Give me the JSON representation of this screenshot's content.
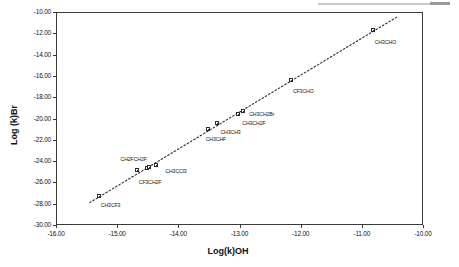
{
  "chart_data": {
    "type": "scatter",
    "title": "",
    "xlabel": "Log(k)OH",
    "ylabel": "Log (k)Br",
    "xlim": [
      -16.0,
      -10.0
    ],
    "ylim": [
      -30.0,
      -10.0
    ],
    "xticks": [
      "-16.00",
      "-15.00",
      "-14.00",
      "-13.00",
      "-12.00",
      "-11.00",
      "-10.00"
    ],
    "xtick_values": [
      -16.0,
      -15.0,
      -14.0,
      -13.0,
      -12.0,
      -11.0,
      -10.0
    ],
    "yticks": [
      "-10.00",
      "-12.00",
      "-14.00",
      "-16.00",
      "-18.00",
      "-20.00",
      "-22.00",
      "-24.00",
      "-26.00",
      "-28.00",
      "-30.00"
    ],
    "ytick_values": [
      -10.0,
      -12.0,
      -14.0,
      -16.0,
      -18.0,
      -20.0,
      -22.0,
      -24.0,
      -26.0,
      -28.0,
      -30.0
    ],
    "grid": false,
    "legend": false,
    "marker_style": "open-square",
    "trendline": {
      "style": "dotted",
      "x_start": -15.45,
      "y_start": -27.9,
      "x_end": -10.42,
      "y_end": -10.45
    },
    "points": [
      {
        "label": "CH3CF3",
        "x": -15.3,
        "y": -27.3,
        "label_dx": 2,
        "label_dy": 6
      },
      {
        "label": "CF3CH2F",
        "x": -14.68,
        "y": -24.8,
        "label_dx": 2,
        "label_dy": 9
      },
      {
        "label": "CH2FCH2F",
        "x": -14.52,
        "y": -24.62,
        "label_dx": -26,
        "label_dy": -12
      },
      {
        "label": "",
        "x": -14.48,
        "y": -24.58,
        "label_dx": 0,
        "label_dy": 0
      },
      {
        "label": "CH3CCl3",
        "x": -14.36,
        "y": -24.35,
        "label_dx": 9,
        "label_dy": 3
      },
      {
        "label": "CH3CHF",
        "x": -13.52,
        "y": -21.02,
        "label_dx": -2,
        "label_dy": 7
      },
      {
        "label": "CH3CH3",
        "x": -13.36,
        "y": -20.4,
        "label_dx": 3,
        "label_dy": 6
      },
      {
        "label": "CH3CH2F",
        "x": -13.02,
        "y": -19.55,
        "label_dx": 4,
        "label_dy": 6
      },
      {
        "label": "CH3CH2Br",
        "x": -12.94,
        "y": -19.3,
        "label_dx": 6,
        "label_dy": 0
      },
      {
        "label": "CF3CHO",
        "x": -12.16,
        "y": -16.4,
        "label_dx": 2,
        "label_dy": 8
      },
      {
        "label": "CH3CHO",
        "x": -10.82,
        "y": -11.72,
        "label_dx": 2,
        "label_dy": 9
      }
    ]
  },
  "figure": {
    "plot_area": {
      "left": 56,
      "top": 12,
      "width": 367,
      "height": 213
    }
  }
}
